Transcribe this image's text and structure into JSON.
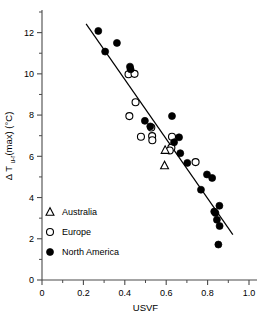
{
  "chart_data": {
    "type": "scatter",
    "title": "",
    "xlabel": "USVF",
    "ylabel": "Δ T",
    "ylabel_sub": "u-r",
    "ylabel_rest": "(max) (°C)",
    "ylabel_full": "Δ Tu-r(max) (°C)",
    "xlim": [
      0,
      1.0
    ],
    "ylim": [
      0,
      13.0
    ],
    "xticks": [
      0,
      0.2,
      0.4,
      0.6,
      0.8,
      1.0
    ],
    "xticklabels": [
      "0",
      "0.2",
      "0.4",
      "0.6",
      "0.8",
      "1.0"
    ],
    "xticks_minor": [
      0.1,
      0.3,
      0.5,
      0.7,
      0.9
    ],
    "yticks": [
      0,
      2,
      4,
      6,
      8,
      10,
      12
    ],
    "yticklabels": [
      "0",
      "2",
      "4",
      "6",
      "8",
      "10",
      "12"
    ],
    "yticks_minor": [
      1,
      3,
      5,
      7,
      9,
      11,
      13
    ],
    "grid": false,
    "legend_position": "lower-left",
    "series": [
      {
        "name": "Australia",
        "marker": "open-triangle",
        "color": "#000000",
        "points": [
          {
            "x": 0.595,
            "y": 6.3
          },
          {
            "x": 0.592,
            "y": 5.55
          }
        ]
      },
      {
        "name": "Europe",
        "marker": "open-circle",
        "color": "#000000",
        "points": [
          {
            "x": 0.418,
            "y": 9.98
          },
          {
            "x": 0.447,
            "y": 10.0
          },
          {
            "x": 0.452,
            "y": 8.62
          },
          {
            "x": 0.422,
            "y": 7.95
          },
          {
            "x": 0.478,
            "y": 6.95
          },
          {
            "x": 0.528,
            "y": 7.4
          },
          {
            "x": 0.532,
            "y": 6.98
          },
          {
            "x": 0.533,
            "y": 6.78
          },
          {
            "x": 0.628,
            "y": 6.95
          },
          {
            "x": 0.625,
            "y": 6.42
          },
          {
            "x": 0.617,
            "y": 6.28
          },
          {
            "x": 0.742,
            "y": 5.72
          }
        ]
      },
      {
        "name": "North America",
        "marker": "filled-circle",
        "color": "#000000",
        "points": [
          {
            "x": 0.272,
            "y": 12.08
          },
          {
            "x": 0.305,
            "y": 11.08
          },
          {
            "x": 0.362,
            "y": 11.5
          },
          {
            "x": 0.425,
            "y": 10.35
          },
          {
            "x": 0.428,
            "y": 10.22
          },
          {
            "x": 0.497,
            "y": 7.72
          },
          {
            "x": 0.523,
            "y": 7.45
          },
          {
            "x": 0.628,
            "y": 7.95
          },
          {
            "x": 0.638,
            "y": 6.68
          },
          {
            "x": 0.662,
            "y": 6.92
          },
          {
            "x": 0.668,
            "y": 6.15
          },
          {
            "x": 0.702,
            "y": 5.68
          },
          {
            "x": 0.768,
            "y": 4.38
          },
          {
            "x": 0.797,
            "y": 5.12
          },
          {
            "x": 0.822,
            "y": 4.95
          },
          {
            "x": 0.832,
            "y": 3.32
          },
          {
            "x": 0.838,
            "y": 3.25
          },
          {
            "x": 0.845,
            "y": 2.92
          },
          {
            "x": 0.857,
            "y": 3.6
          },
          {
            "x": 0.858,
            "y": 2.62
          },
          {
            "x": 0.852,
            "y": 1.72
          }
        ]
      }
    ],
    "fit_line": {
      "x1": 0.213,
      "y1": 12.42,
      "x2": 0.922,
      "y2": 2.2
    }
  },
  "legend": {
    "items": [
      {
        "label": "Australia",
        "marker": "open-triangle"
      },
      {
        "label": "Europe",
        "marker": "open-circle"
      },
      {
        "label": "North America",
        "marker": "filled-circle"
      }
    ]
  }
}
